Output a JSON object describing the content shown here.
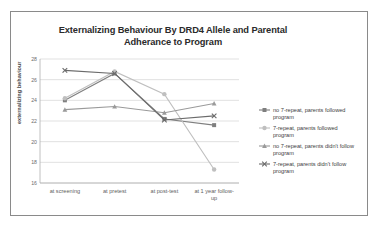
{
  "chart_data": {
    "type": "line",
    "title": "Externalizing Behaviour By DRD4 Allele and Parental Adherance to Program",
    "title_line1": "Externalizing Behaviour By DRD4 Allele and Parental",
    "title_line2": "Adherance to Program",
    "xlabel": "",
    "ylabel": "externalizing behaviour",
    "categories": [
      "at screening",
      "at pretest",
      "at post-test",
      "at 1 year follow-up"
    ],
    "ylim": [
      16,
      28
    ],
    "yticks": [
      16,
      18,
      20,
      22,
      24,
      26,
      28
    ],
    "grid": true,
    "legend_position": "right",
    "series": [
      {
        "name": "no 7-repeat, parents followed program",
        "name_line1": "no 7-repeat, parents followed",
        "name_line2": "program",
        "values": [
          24.0,
          26.6,
          22.2,
          21.6
        ],
        "color": "#7f7f7f",
        "marker": "square"
      },
      {
        "name": "7-repeat, parents followed program",
        "name_line1": "7-repeat, parents followed",
        "name_line2": "program",
        "values": [
          24.2,
          26.8,
          24.6,
          17.3
        ],
        "color": "#bfbfbf",
        "marker": "circle"
      },
      {
        "name": "no 7-repeat, parents didn't follow program",
        "name_line1": "no 7-repeat, parents didn't follow",
        "name_line2": "program",
        "values": [
          23.1,
          23.4,
          22.8,
          23.7
        ],
        "color": "#9a9a9a",
        "marker": "triangle"
      },
      {
        "name": "7-repeat, parents didn't follow program",
        "name_line1": "7-repeat, parents didn't follow",
        "name_line2": "program",
        "values": [
          26.9,
          26.6,
          22.1,
          22.5
        ],
        "color": "#6b6b6b",
        "marker": "cross"
      }
    ]
  }
}
